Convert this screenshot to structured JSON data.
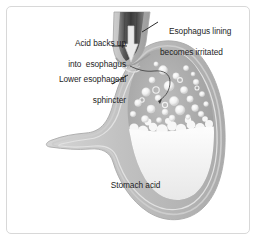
{
  "figure": {
    "background_color": "#ffffff",
    "border_color": "#d8d8d8",
    "text_color": "#1e1e1e"
  },
  "labels": {
    "acid_backs_up": {
      "line1": "Acid backs up",
      "line2": "into  esophagus"
    },
    "lower_esophageal_sphincter": {
      "line1": "Lower esophageal",
      "line2": "sphincter"
    },
    "esophagus_lining": {
      "line1": "Esophagus lining",
      "line2": "becomes irritated"
    },
    "stomach_acid": {
      "line1": "Stomach acid"
    }
  },
  "anatomy": {
    "esophagus": "esophagus-tube",
    "reflux_arrow": "up-arrow",
    "sphincter": "lower-esophageal-sphincter",
    "stomach_body": "stomach",
    "gas_bubbles": "bubbles",
    "acid_fluid": "stomach-acid-fluid",
    "duodenum": "duodenum"
  },
  "colors": {
    "esophagus_dark": "#4a4a4a",
    "stomach_wall": "#b9b9b9",
    "stomach_gas": "#9a9a9a",
    "acid_fluid": "#efefef",
    "bubble": "#ffffff",
    "leader_line": "#2a2a2a"
  }
}
